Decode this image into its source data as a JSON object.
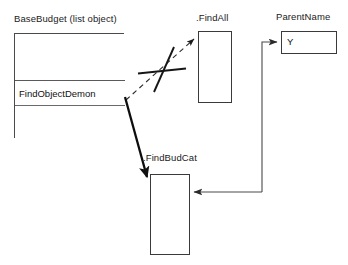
{
  "diagram": {
    "title_label": "BaseBudget (list object)",
    "nodes": {
      "basebudget": {
        "label": "BaseBudget (list object)",
        "cells": [
          {
            "text": ""
          },
          {
            "text": "FindObjectDemon"
          },
          {
            "text": ""
          }
        ]
      },
      "findall": {
        "label": ".FindAll",
        "text": ""
      },
      "findbudcat": {
        "label": ".FindBudCat",
        "text": ""
      },
      "parentname": {
        "label": "ParentName",
        "value": "Y"
      }
    },
    "edges": [
      {
        "name": "findobjectdemon-to-findall",
        "style": "dashed",
        "marker": "arrow",
        "crossed_out": true,
        "from": "FindObjectDemon",
        "to": ".FindAll"
      },
      {
        "name": "findobjectdemon-to-findbudcat",
        "style": "solid-thick",
        "marker": "arrow",
        "crossed_out": false,
        "from": "FindObjectDemon",
        "to": ".FindBudCat"
      },
      {
        "name": "parentname-to-findbudcat",
        "style": "solid",
        "marker": "arrow",
        "crossed_out": false,
        "from": "ParentName",
        "to": ".FindBudCat"
      }
    ],
    "colors": {
      "stroke": "#3a3a3a",
      "text": "#111111",
      "background": "#ffffff"
    }
  }
}
